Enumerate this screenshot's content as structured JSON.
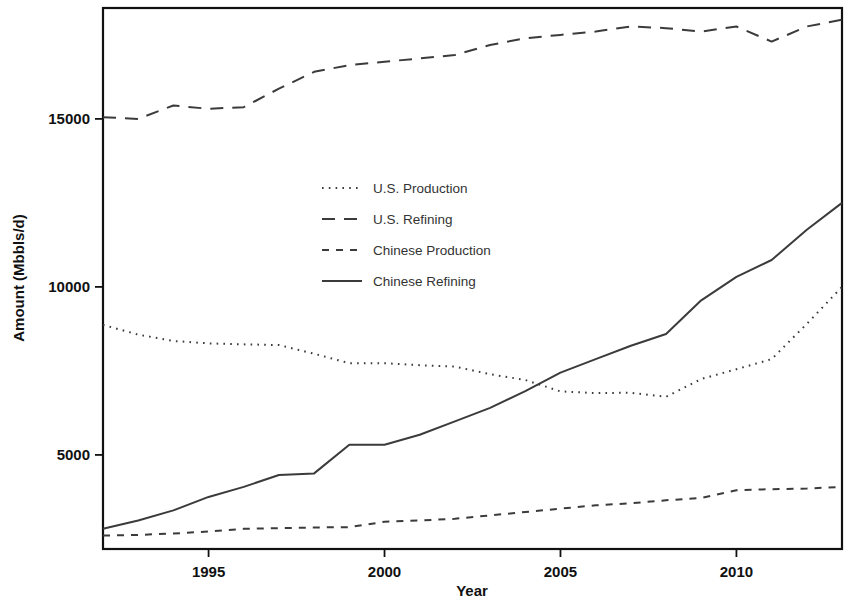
{
  "chart_data": {
    "type": "line",
    "title": "",
    "xlabel": "Year",
    "ylabel": "Amount (Mbbls/d)",
    "xlim": [
      1992,
      2013
    ],
    "ylim": [
      2200,
      18300
    ],
    "xticks": [
      1995,
      2000,
      2005,
      2010
    ],
    "xtick_labels": [
      "1995",
      "2000",
      "2005",
      "2010"
    ],
    "yticks": [
      5000,
      10000,
      15000
    ],
    "ytick_labels": [
      "5000",
      "10000",
      "15000"
    ],
    "grid": false,
    "legend_position": "center-left-upper",
    "x": [
      1992,
      1993,
      1994,
      1995,
      1996,
      1997,
      1998,
      1999,
      2000,
      2001,
      2002,
      2003,
      2004,
      2005,
      2006,
      2007,
      2008,
      2009,
      2010,
      2011,
      2012,
      2013
    ],
    "series": [
      {
        "name": "U.S. Production",
        "style": "dotted",
        "values": [
          8870,
          8580,
          8390,
          8320,
          8290,
          8270,
          8010,
          7730,
          7730,
          7670,
          7630,
          7400,
          7230,
          6890,
          6840,
          6850,
          6730,
          7260,
          7550,
          7850,
          8900,
          10000
        ]
      },
      {
        "name": "U.S. Refining",
        "style": "dashed-long",
        "values": [
          15050,
          15000,
          15400,
          15300,
          15350,
          15900,
          16400,
          16600,
          16700,
          16800,
          16900,
          17200,
          17400,
          17500,
          17600,
          17750,
          17700,
          17600,
          17750,
          17300,
          17750,
          17950
        ]
      },
      {
        "name": "Chinese Production",
        "style": "dashed-short",
        "values": [
          2600,
          2620,
          2660,
          2720,
          2800,
          2820,
          2840,
          2850,
          3010,
          3050,
          3100,
          3200,
          3300,
          3400,
          3500,
          3560,
          3650,
          3720,
          3950,
          3980,
          4000,
          4050
        ]
      },
      {
        "name": "Chinese Refining",
        "style": "solid",
        "values": [
          2800,
          3050,
          3350,
          3750,
          4050,
          4400,
          4450,
          5300,
          5300,
          5600,
          6000,
          6400,
          6900,
          7450,
          7850,
          8250,
          8600,
          9600,
          10300,
          10800,
          11700,
          12500
        ]
      }
    ]
  },
  "axes": {
    "y_axis_title": "Amount (Mbbls/d)",
    "x_axis_title": "Year"
  },
  "legend": {
    "entries": [
      {
        "label": "U.S. Production",
        "style": "dotted"
      },
      {
        "label": "U.S. Refining",
        "style": "dashed-long"
      },
      {
        "label": "Chinese Production",
        "style": "dashed-short"
      },
      {
        "label": "Chinese Refining",
        "style": "solid"
      }
    ]
  }
}
